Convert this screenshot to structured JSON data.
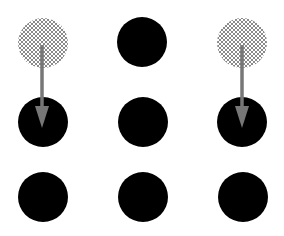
{
  "diagram": {
    "type": "dot-grid-movement",
    "grid": {
      "rows": 3,
      "cols": 3
    },
    "colors": {
      "background": "#ffffff",
      "dot": "#000000",
      "hatch_dot_fill": "#ffffff",
      "hatch_line": "#8a8a8a",
      "arrow": "#777777"
    },
    "dot_radius": 25,
    "dots": [
      {
        "id": "r1c1",
        "row": 1,
        "col": 1,
        "cx": 43,
        "cy": 43,
        "style": "hatched"
      },
      {
        "id": "r1c2",
        "row": 1,
        "col": 2,
        "cx": 142,
        "cy": 42,
        "style": "solid"
      },
      {
        "id": "r1c3",
        "row": 1,
        "col": 3,
        "cx": 242,
        "cy": 43,
        "style": "hatched"
      },
      {
        "id": "r2c1",
        "row": 2,
        "col": 1,
        "cx": 43,
        "cy": 122,
        "style": "solid"
      },
      {
        "id": "r2c2",
        "row": 2,
        "col": 2,
        "cx": 143,
        "cy": 122,
        "style": "solid"
      },
      {
        "id": "r2c3",
        "row": 2,
        "col": 3,
        "cx": 242,
        "cy": 122,
        "style": "solid"
      },
      {
        "id": "r3c1",
        "row": 3,
        "col": 1,
        "cx": 43,
        "cy": 197,
        "style": "solid"
      },
      {
        "id": "r3c2",
        "row": 3,
        "col": 2,
        "cx": 143,
        "cy": 197,
        "style": "solid"
      },
      {
        "id": "r3c3",
        "row": 3,
        "col": 3,
        "cx": 243,
        "cy": 197,
        "style": "solid"
      }
    ],
    "arrows": [
      {
        "id": "arrow-left",
        "from": "r1c1",
        "to": "r2c1",
        "x": 42,
        "y1": 45,
        "y2": 128
      },
      {
        "id": "arrow-right",
        "from": "r1c3",
        "to": "r2c3",
        "x": 242,
        "y1": 45,
        "y2": 128
      }
    ]
  }
}
